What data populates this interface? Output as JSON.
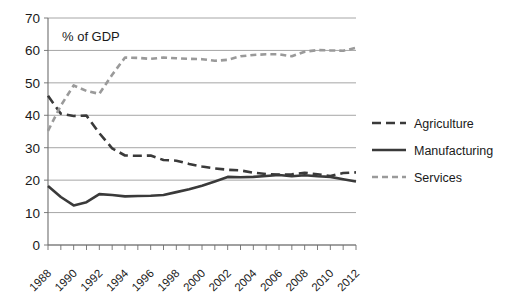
{
  "chart_data": {
    "type": "line",
    "title": "",
    "annotation": "% of GDP",
    "xlabel": "",
    "ylabel": "",
    "ylim": [
      0,
      70
    ],
    "ytick_step": 10,
    "yticks": [
      0,
      10,
      20,
      30,
      40,
      50,
      60,
      70
    ],
    "xlim": [
      1988,
      2012
    ],
    "xticks_all_years": [
      1988,
      1989,
      1990,
      1991,
      1992,
      1993,
      1994,
      1995,
      1996,
      1997,
      1998,
      1999,
      2000,
      2001,
      2002,
      2003,
      2004,
      2005,
      2006,
      2007,
      2008,
      2009,
      2010,
      2011,
      2012
    ],
    "xtick_labels": [
      "1988",
      "1990",
      "1992",
      "1994",
      "1996",
      "1998",
      "2000",
      "2002",
      "2004",
      "2006",
      "2008",
      "2010",
      "2012"
    ],
    "xtick_label_years": [
      1988,
      1990,
      1992,
      1994,
      1996,
      1998,
      2000,
      2002,
      2004,
      2006,
      2008,
      2010,
      2012
    ],
    "grid": true,
    "grid_axis": "y",
    "legend_position": "right",
    "x": [
      1988,
      1989,
      1990,
      1991,
      1992,
      1993,
      1994,
      1995,
      1996,
      1997,
      1998,
      1999,
      2000,
      2001,
      2002,
      2003,
      2004,
      2005,
      2006,
      2007,
      2008,
      2009,
      2010,
      2011,
      2012
    ],
    "series": [
      {
        "name": "Agriculture",
        "color": "#3a3a3a",
        "style": "long-dash",
        "dasharray": "9,5",
        "width": 2.6,
        "values": [
          46.0,
          40.5,
          39.8,
          39.9,
          34.5,
          29.8,
          27.6,
          27.5,
          27.6,
          26.2,
          26.0,
          25.0,
          24.2,
          23.6,
          23.2,
          23.0,
          22.3,
          21.9,
          21.7,
          21.8,
          22.3,
          21.8,
          21.3,
          22.2,
          22.4
        ]
      },
      {
        "name": "Manufacturing",
        "color": "#3a3a3a",
        "style": "solid",
        "dasharray": "",
        "width": 2.6,
        "values": [
          18.2,
          14.8,
          12.2,
          13.2,
          15.7,
          15.4,
          15.0,
          15.1,
          15.2,
          15.4,
          16.3,
          17.2,
          18.3,
          19.6,
          21.0,
          20.9,
          21.0,
          21.3,
          21.6,
          21.2,
          21.5,
          21.2,
          21.0,
          20.3,
          19.6
        ]
      },
      {
        "name": "Services",
        "color": "#9a9a9a",
        "style": "short-dash",
        "dasharray": "6,4",
        "width": 2.6,
        "values": [
          35.2,
          43.0,
          49.2,
          47.5,
          46.6,
          52.5,
          57.8,
          57.7,
          57.4,
          57.8,
          57.6,
          57.4,
          57.3,
          56.8,
          57.1,
          58.2,
          58.6,
          58.8,
          58.8,
          58.2,
          59.6,
          60.1,
          60.0,
          59.9,
          60.8
        ]
      }
    ]
  },
  "legend": {
    "items": [
      {
        "label": "Agriculture"
      },
      {
        "label": "Manufacturing"
      },
      {
        "label": "Services"
      }
    ]
  }
}
